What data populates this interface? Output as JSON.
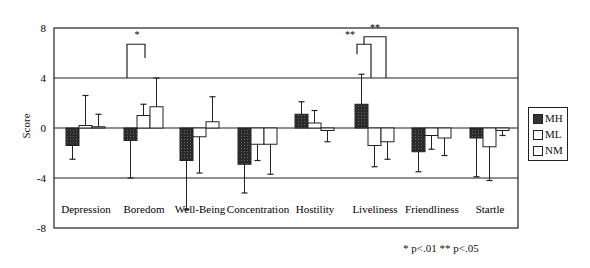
{
  "chart_data": {
    "type": "bar",
    "title": "",
    "xlabel": "",
    "ylabel": "Score",
    "ylim": [
      -8,
      8
    ],
    "yticks": [
      8,
      4,
      0,
      -4,
      -8
    ],
    "grid": "horizontal lines at 4, 0, -4",
    "legend_position": "right",
    "categories": [
      "Depression",
      "Boredom",
      "Well-Being",
      "Concentration",
      "Hostility",
      "Liveliness",
      "Friendliness",
      "Startle"
    ],
    "series": [
      {
        "name": "MH",
        "fill": "#333333",
        "pattern": "dark-stipple",
        "values": [
          -1.4,
          -1.0,
          -2.6,
          -2.9,
          1.1,
          1.9,
          -1.9,
          -0.8
        ],
        "error_ends": [
          -2.5,
          -4.0,
          -6.5,
          -5.2,
          2.1,
          4.3,
          -3.5,
          -3.9
        ]
      },
      {
        "name": "ML",
        "fill": "#ffffff",
        "values": [
          0.2,
          1.0,
          -0.7,
          -1.3,
          0.4,
          -1.4,
          -0.6,
          -1.5
        ],
        "error_ends": [
          2.6,
          1.9,
          -3.6,
          -2.6,
          1.4,
          -3.1,
          -1.7,
          -4.2
        ]
      },
      {
        "name": "NM",
        "fill": "#ffffff",
        "values": [
          0.1,
          1.7,
          0.5,
          -1.3,
          -0.2,
          -1.1,
          -0.8,
          -0.2
        ],
        "error_ends": [
          1.1,
          4.0,
          2.5,
          -3.7,
          -1.1,
          -2.5,
          -2.2,
          -0.6
        ]
      }
    ],
    "annotations": [
      {
        "category": "Boredom",
        "label": "*",
        "bracket": "MH-NM"
      },
      {
        "category": "Liveliness",
        "label": "**",
        "bracket": "MH-ML"
      },
      {
        "category": "Liveliness",
        "label": "**",
        "bracket": "MH-NM"
      }
    ],
    "footnote": "* p<.01  ** p<.05"
  },
  "labels": {
    "ylabel": "Score",
    "legend": [
      "MH",
      "ML",
      "NM"
    ],
    "footnote": "* p<.01  ** p<.05"
  }
}
